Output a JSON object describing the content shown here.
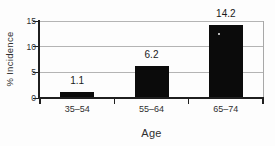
{
  "chart_data": {
    "type": "bar",
    "categories": [
      "35–54",
      "55–64",
      "65–74"
    ],
    "values": [
      1.1,
      6.2,
      14.2
    ],
    "bar_labels": [
      "1.1",
      "6.2",
      "14.2"
    ],
    "xlabel": "Age",
    "ylabel": "% Incidence",
    "ylim": [
      0,
      15
    ],
    "yticks": [
      0,
      5,
      10,
      15
    ],
    "grid": "horizontal",
    "legend": "none",
    "bar_color": "#0b0b0b",
    "axis_color": "#1f1f1f",
    "gridline_color": "#b4b4b4",
    "background_color": "#fdfdfd",
    "text_color": "#2f2f2f"
  }
}
